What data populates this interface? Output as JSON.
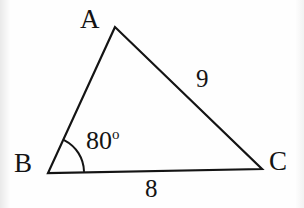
{
  "figure": {
    "kind": "geometry-diagram",
    "shape": "triangle",
    "background_color": "#fefefe",
    "stroke_color": "#141414",
    "text_color": "#141414",
    "stroke_width": 2.2,
    "vertices": [
      {
        "name": "A",
        "label": "A",
        "x": 115,
        "y": 27
      },
      {
        "name": "B",
        "label": "B",
        "x": 48,
        "y": 173
      },
      {
        "name": "C",
        "label": "C",
        "x": 262,
        "y": 169
      }
    ],
    "sides": [
      {
        "name": "AB",
        "label": "",
        "from": "A",
        "to": "B"
      },
      {
        "name": "AC",
        "label": "9",
        "from": "A",
        "to": "C"
      },
      {
        "name": "BC",
        "label": "8",
        "from": "B",
        "to": "C"
      }
    ],
    "angles": [
      {
        "at": "B",
        "value": "80",
        "unit": "o",
        "label": "80o",
        "arc_radius": 36
      }
    ]
  },
  "labels": {
    "vertex_a": "A",
    "vertex_b": "B",
    "vertex_c": "C",
    "side_ac": "9",
    "side_bc": "8",
    "angle_b_value": "80",
    "angle_b_degree_symbol": "o"
  },
  "geometry": {
    "polygon_points": "115,27 48,173 262,169",
    "arc_path": "M 84,171.3 A 36 36 0 0 0 64.5,140.3"
  }
}
